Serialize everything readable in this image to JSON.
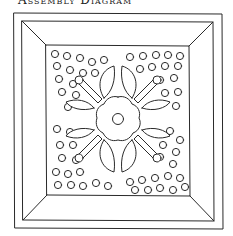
{
  "title": "Assembly Diagram",
  "colors": {
    "line": "#2a2a2a",
    "background": "#ffffff"
  },
  "diagram": {
    "outer_frame": [
      14,
      13,
      222,
      229
    ],
    "inner_frame": [
      22,
      21,
      213,
      221
    ],
    "center_panel": [
      46,
      45,
      189,
      196
    ],
    "flower_center": [
      118,
      119
    ],
    "dots": [
      [
        55,
        54
      ],
      [
        67,
        56
      ],
      [
        80,
        58
      ],
      [
        92,
        62
      ],
      [
        104,
        60
      ],
      [
        57,
        66
      ],
      [
        70,
        70
      ],
      [
        83,
        73
      ],
      [
        95,
        73
      ],
      [
        59,
        79
      ],
      [
        73,
        84
      ],
      [
        62,
        92
      ],
      [
        76,
        95
      ],
      [
        68,
        107
      ],
      [
        130,
        57
      ],
      [
        143,
        56
      ],
      [
        156,
        55
      ],
      [
        168,
        55
      ],
      [
        180,
        56
      ],
      [
        140,
        69
      ],
      [
        152,
        67
      ],
      [
        165,
        66
      ],
      [
        178,
        66
      ],
      [
        160,
        80
      ],
      [
        174,
        78
      ],
      [
        165,
        93
      ],
      [
        178,
        92
      ],
      [
        176,
        106
      ],
      [
        57,
        129
      ],
      [
        70,
        132
      ],
      [
        60,
        145
      ],
      [
        73,
        145
      ],
      [
        62,
        158
      ],
      [
        76,
        160
      ],
      [
        56,
        172
      ],
      [
        68,
        174
      ],
      [
        80,
        172
      ],
      [
        58,
        185
      ],
      [
        71,
        185
      ],
      [
        83,
        186
      ],
      [
        96,
        183
      ],
      [
        108,
        186
      ],
      [
        170,
        131
      ],
      [
        180,
        140
      ],
      [
        163,
        145
      ],
      [
        176,
        152
      ],
      [
        160,
        157
      ],
      [
        173,
        164
      ],
      [
        130,
        182
      ],
      [
        142,
        180
      ],
      [
        155,
        178
      ],
      [
        168,
        176
      ],
      [
        180,
        178
      ],
      [
        135,
        190
      ],
      [
        148,
        190
      ],
      [
        160,
        188
      ],
      [
        173,
        190
      ],
      [
        185,
        187
      ]
    ]
  }
}
